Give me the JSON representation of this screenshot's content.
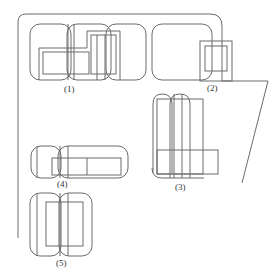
{
  "diagram": {
    "labels": {
      "group1": "(1)",
      "group2": "(2)",
      "group3": "(3)",
      "group4": "(4)",
      "group5": "(5)"
    },
    "stroke_color": "#6a6a6a",
    "background": "#ffffff"
  }
}
